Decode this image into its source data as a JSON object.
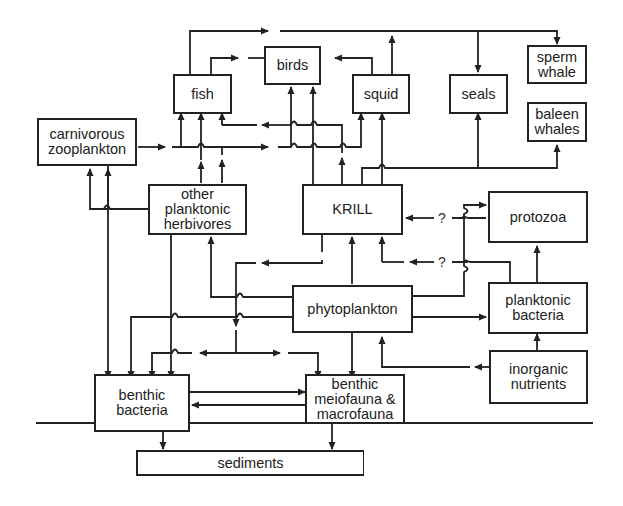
{
  "diagram": {
    "nodes": {
      "fish": "fish",
      "birds": "birds",
      "squid": "squid",
      "seals": "seals",
      "sperm_whale": "sperm\nwhale",
      "baleen_whales": "baleen\nwhales",
      "carnivorous_zooplankton": "carnivorous\nzooplankton",
      "other_planktonic_herbivores": "other\nplanktonic\nherbivores",
      "krill": "KRILL",
      "protozoa": "protozoa",
      "phytoplankton": "phytoplankton",
      "planktonic_bacteria": "planktonic\nbacteria",
      "inorganic_nutrients": "inorganic\nnutrients",
      "benthic_bacteria": "benthic\nbacteria",
      "benthic_fauna": "benthic\nmeiofauna &\nmacrofauna",
      "sediments": "sediments"
    },
    "uncertain_label": "?",
    "edges": [
      {
        "from": "carnivorous zooplankton",
        "to": "fish"
      },
      {
        "from": "carnivorous zooplankton",
        "to": "birds"
      },
      {
        "from": "carnivorous zooplankton",
        "to": "squid"
      },
      {
        "from": "carnivorous zooplankton",
        "to": "benthic bacteria"
      },
      {
        "from": "other planktonic herbivores",
        "to": "fish"
      },
      {
        "from": "other planktonic herbivores",
        "to": "carnivorous zooplankton"
      },
      {
        "from": "other planktonic herbivores",
        "to": "benthic bacteria"
      },
      {
        "from": "fish",
        "to": "birds"
      },
      {
        "from": "fish",
        "to": "seals"
      },
      {
        "from": "fish",
        "to": "sperm whale"
      },
      {
        "from": "squid",
        "to": "birds"
      },
      {
        "from": "squid",
        "to": "seals"
      },
      {
        "from": "squid",
        "to": "sperm whale"
      },
      {
        "from": "KRILL",
        "to": "fish"
      },
      {
        "from": "KRILL",
        "to": "birds"
      },
      {
        "from": "KRILL",
        "to": "squid"
      },
      {
        "from": "KRILL",
        "to": "seals"
      },
      {
        "from": "KRILL",
        "to": "baleen whales"
      },
      {
        "from": "KRILL",
        "to": "benthic bacteria"
      },
      {
        "from": "KRILL",
        "to": "benthic fauna"
      },
      {
        "from": "protozoa",
        "to": "KRILL",
        "label": "?"
      },
      {
        "from": "planktonic bacteria",
        "to": "KRILL",
        "label": "?"
      },
      {
        "from": "phytoplankton",
        "to": "KRILL"
      },
      {
        "from": "phytoplankton",
        "to": "other planktonic herbivores"
      },
      {
        "from": "phytoplankton",
        "to": "protozoa"
      },
      {
        "from": "phytoplankton",
        "to": "planktonic bacteria"
      },
      {
        "from": "phytoplankton",
        "to": "benthic bacteria"
      },
      {
        "from": "phytoplankton",
        "to": "benthic fauna"
      },
      {
        "from": "planktonic bacteria",
        "to": "protozoa"
      },
      {
        "from": "inorganic nutrients",
        "to": "planktonic bacteria"
      },
      {
        "from": "inorganic nutrients",
        "to": "phytoplankton"
      },
      {
        "from": "benthic bacteria",
        "to": "benthic fauna"
      },
      {
        "from": "benthic fauna",
        "to": "benthic bacteria"
      },
      {
        "from": "benthic bacteria",
        "to": "sediments"
      },
      {
        "from": "benthic fauna",
        "to": "sediments"
      }
    ]
  }
}
